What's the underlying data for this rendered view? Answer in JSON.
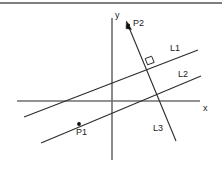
{
  "figure": {
    "width": 222,
    "height": 172,
    "background_color": "#ffffff",
    "border": {
      "top_rule_color": "#555555"
    }
  },
  "axes": {
    "color": "#6e6e6e",
    "x": {
      "label": "x",
      "label_x": 203,
      "label_y": 104,
      "from": [
        17,
        101
      ],
      "to": [
        200,
        101
      ]
    },
    "y": {
      "label": "y",
      "label_x": 115,
      "label_y": 11,
      "from": [
        112,
        18
      ],
      "to": [
        112,
        160
      ]
    }
  },
  "lines": [
    {
      "name": "L1",
      "label": "L1",
      "label_x": 170,
      "label_y": 44,
      "from": [
        24,
        117
      ],
      "to": [
        198,
        50
      ],
      "color": "#2b2b2b"
    },
    {
      "name": "L2",
      "label": "L2",
      "label_x": 178,
      "label_y": 70,
      "from": [
        41,
        143
      ],
      "to": [
        201,
        76
      ],
      "color": "#2b2b2b"
    },
    {
      "name": "L3",
      "label": "L3",
      "label_x": 153,
      "label_y": 124,
      "from": [
        127,
        22
      ],
      "to": [
        176,
        141
      ],
      "color": "#2b2b2b",
      "arrow": {
        "at": [
          127,
          22
        ],
        "direction": "up-left"
      }
    }
  ],
  "points": [
    {
      "name": "P1",
      "label": "P1",
      "dot_x": 79,
      "dot_y": 124,
      "label_x": 76,
      "label_y": 128,
      "on_line": "L2"
    },
    {
      "name": "P2",
      "label": "P2",
      "dot_x": 128,
      "dot_y": 24,
      "label_x": 133,
      "label_y": 19,
      "on_line": "L3"
    }
  ],
  "markers": [
    {
      "name": "right-angle",
      "kind": "perpendicular-square",
      "x": 146,
      "y": 57,
      "size": 7,
      "between": [
        "L1",
        "L3"
      ]
    }
  ]
}
